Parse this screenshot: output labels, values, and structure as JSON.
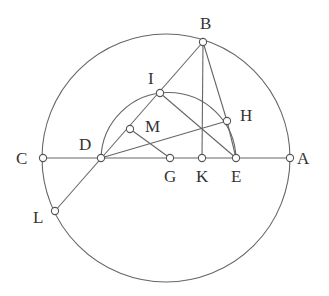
{
  "diagram": {
    "type": "geometry-construction",
    "stroke_color": "#666666",
    "label_color": "#333333",
    "big_circle": {
      "cx": 166,
      "cy": 158,
      "r": 124
    },
    "small_arc": {
      "from": "D",
      "to": "E",
      "through": "I"
    },
    "points": [
      {
        "name": "A",
        "x": 290,
        "y": 158,
        "label_x": 297,
        "label_y": 164
      },
      {
        "name": "B",
        "x": 203,
        "y": 42,
        "label_x": 200,
        "label_y": 29
      },
      {
        "name": "C",
        "x": 43,
        "y": 158,
        "label_x": 16,
        "label_y": 164
      },
      {
        "name": "D",
        "x": 101,
        "y": 158,
        "label_x": 79,
        "label_y": 150
      },
      {
        "name": "E",
        "x": 236,
        "y": 158,
        "label_x": 231,
        "label_y": 182
      },
      {
        "name": "G",
        "x": 170,
        "y": 158,
        "label_x": 164,
        "label_y": 182
      },
      {
        "name": "H",
        "x": 227,
        "y": 121,
        "label_x": 240,
        "label_y": 121
      },
      {
        "name": "I",
        "x": 160,
        "y": 93,
        "label_x": 148,
        "label_y": 84
      },
      {
        "name": "K",
        "x": 202,
        "y": 158,
        "label_x": 196,
        "label_y": 182
      },
      {
        "name": "L",
        "x": 55,
        "y": 211,
        "label_x": 33,
        "label_y": 223
      },
      {
        "name": "M",
        "x": 130,
        "y": 129,
        "label_x": 145,
        "label_y": 132
      }
    ],
    "segments": [
      [
        "C",
        "A"
      ],
      [
        "B",
        "L"
      ],
      [
        "B",
        "K"
      ],
      [
        "B",
        "H"
      ],
      [
        "H",
        "E"
      ],
      [
        "D",
        "H"
      ],
      [
        "I",
        "E"
      ],
      [
        "M",
        "G"
      ]
    ]
  }
}
